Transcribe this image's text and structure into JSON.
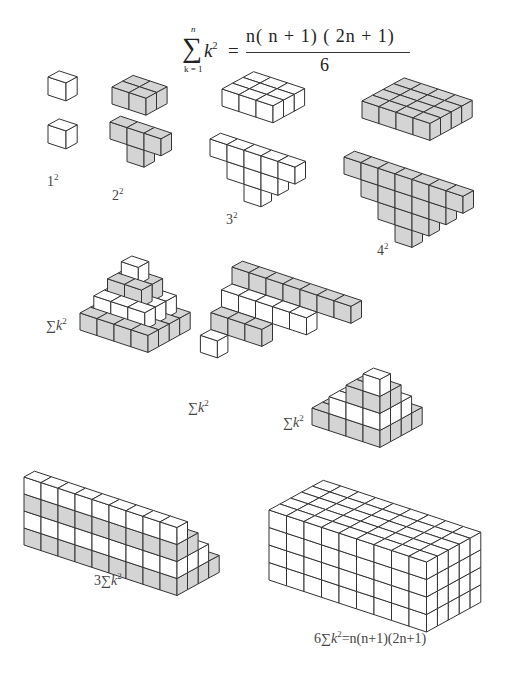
{
  "title_formula": {
    "sigma": "∑",
    "upper": "n",
    "lower": "k = 1",
    "term": "k",
    "term_exp": "2",
    "equals": "=",
    "numerator": "n( n + 1) ( 2n + 1)",
    "denominator": "6"
  },
  "labels": {
    "one_sq": {
      "base": "1",
      "exp": "2"
    },
    "two_sq": {
      "base": "2",
      "exp": "2"
    },
    "three_sq": {
      "base": "3",
      "exp": "2"
    },
    "four_sq": {
      "base": "4",
      "exp": "2"
    },
    "pyramid": {
      "sigma": "∑",
      "var": "k",
      "exp": "2"
    },
    "staircase_a": {
      "sigma": "∑",
      "var": "k",
      "exp": "2"
    },
    "staircase_b": {
      "sigma": "∑",
      "var": "k",
      "exp": "2"
    },
    "three_sum": {
      "coef": "3",
      "sigma": "∑",
      "var": "k",
      "exp": "2"
    },
    "six_sum": {
      "coef": "6",
      "sigma": "∑",
      "var": "k",
      "exp": "2",
      "rhs": "=n(n+1)(2n+1)"
    }
  },
  "colors": {
    "shaded_face": "#d4d4d4",
    "white_face": "#ffffff",
    "edge": "#333333",
    "bold_edge": "#111111"
  },
  "figures": [
    {
      "id": "square-1",
      "caption": "1²",
      "layouts": [
        "1 cube block",
        "1 cube"
      ]
    },
    {
      "id": "square-2",
      "caption": "2²",
      "layouts": [
        "2×2 slab",
        "T-shape rearrangement"
      ]
    },
    {
      "id": "square-3",
      "caption": "3²",
      "layouts": [
        "3×3 slab",
        "triangular rearrangement"
      ]
    },
    {
      "id": "square-4",
      "caption": "4²",
      "layouts": [
        "4×4 slab",
        "triangular rearrangement"
      ]
    },
    {
      "id": "pyramid",
      "caption": "∑k²"
    },
    {
      "id": "staircase-a",
      "caption": "∑k²"
    },
    {
      "id": "staircase-b",
      "caption": "∑k²"
    },
    {
      "id": "three-copies",
      "caption": "3∑k²"
    },
    {
      "id": "box",
      "caption": "6∑k²=n(n+1)(2n+1)"
    }
  ]
}
